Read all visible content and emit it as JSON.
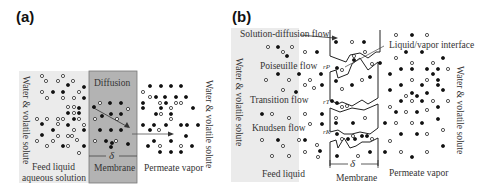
{
  "panel_a": {
    "label": "(a)",
    "side_label_left": "Water & volatile solute",
    "side_label_right": "Water & volatile solute",
    "mechanism": "Diffusion",
    "thickness_symbol": "δ",
    "regions": {
      "feed": "Feed liquid",
      "feed_sub": "aqueous solution",
      "membrane": "Membrane",
      "permeate": "Permeate vapor"
    },
    "colors": {
      "feed_bg": "#ebebeb",
      "membrane_bg": "#b3b3b3"
    }
  },
  "panel_b": {
    "label": "(b)",
    "side_label_left": "Water & volatile solute",
    "side_label_right": "Water & volatile solute",
    "flows": [
      "Solution-diffusion flow",
      "Poiseuille flow",
      "Transition flow",
      "Knudsen flow"
    ],
    "pore_radii": [
      "rP",
      "rT",
      "rK"
    ],
    "interface_label": "Liquid/vapor interface",
    "thickness_symbol": "δ",
    "regions": {
      "feed": "Feed liquid",
      "membrane": "Membrane",
      "permeate": "Permeate vapor"
    },
    "colors": {
      "feed_bg": "#ebebeb"
    }
  }
}
